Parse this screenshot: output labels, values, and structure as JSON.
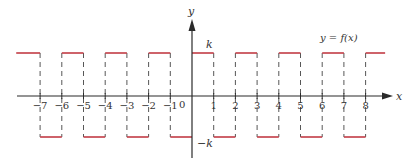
{
  "figure": {
    "function_label": "y = f(x)",
    "axis_x_label": "x",
    "axis_y_label": "y",
    "level_high_label": "k",
    "level_low_label": "−k",
    "origin_label": "0",
    "x_ticks": [
      -7,
      -6,
      -5,
      -4,
      -3,
      -2,
      -1,
      1,
      2,
      3,
      4,
      5,
      6,
      7,
      8
    ],
    "x_tick_labels": [
      "−7",
      "−6",
      "−5",
      "−4",
      "−3",
      "−2",
      "−1",
      "1",
      "2",
      "3",
      "4",
      "5",
      "6",
      "7",
      "8"
    ],
    "colors": {
      "curve": "#c23b45",
      "axes": "#2a2a2a",
      "dashes": "#444444",
      "text": "#333333"
    }
  },
  "chart_data": {
    "type": "line",
    "title": "y = f(x)",
    "xlabel": "x",
    "ylabel": "y",
    "xlim": [
      -8.1,
      8.9
    ],
    "ylim": [
      "-k",
      "k"
    ],
    "levels": {
      "high": "k",
      "low": "-k"
    },
    "segments": [
      {
        "x_start": -8.1,
        "x_end": -7,
        "y": "k"
      },
      {
        "x_start": -7,
        "x_end": -6,
        "y": "-k"
      },
      {
        "x_start": -6,
        "x_end": -5,
        "y": "k"
      },
      {
        "x_start": -5,
        "x_end": -4,
        "y": "-k"
      },
      {
        "x_start": -4,
        "x_end": -3,
        "y": "k"
      },
      {
        "x_start": -3,
        "x_end": -2,
        "y": "-k"
      },
      {
        "x_start": -2,
        "x_end": -1,
        "y": "k"
      },
      {
        "x_start": -1,
        "x_end": 0,
        "y": "-k"
      },
      {
        "x_start": 0,
        "x_end": 1,
        "y": "k"
      },
      {
        "x_start": 1,
        "x_end": 2,
        "y": "-k"
      },
      {
        "x_start": 2,
        "x_end": 3,
        "y": "k"
      },
      {
        "x_start": 3,
        "x_end": 4,
        "y": "-k"
      },
      {
        "x_start": 4,
        "x_end": 5,
        "y": "k"
      },
      {
        "x_start": 5,
        "x_end": 6,
        "y": "-k"
      },
      {
        "x_start": 6,
        "x_end": 7,
        "y": "k"
      },
      {
        "x_start": 7,
        "x_end": 8,
        "y": "-k"
      },
      {
        "x_start": 8,
        "x_end": 8.9,
        "y": "k"
      }
    ],
    "x_ticks": [
      -7,
      -6,
      -5,
      -4,
      -3,
      -2,
      -1,
      0,
      1,
      2,
      3,
      4,
      5,
      6,
      7,
      8
    ],
    "grid": false,
    "legend": "none",
    "annotations": [
      "y = f(x)",
      "k",
      "−k"
    ]
  }
}
